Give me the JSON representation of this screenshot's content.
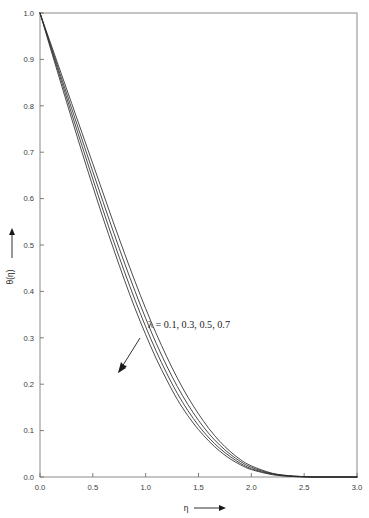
{
  "figure": {
    "background_color": "#ffffff",
    "frame_color": "#8a8a8a",
    "curve_color": "#2b2b2b"
  },
  "chart_data": {
    "type": "line",
    "title": "",
    "subtitle": "",
    "xlabel": "η",
    "ylabel": "θ(η)",
    "xlabel_arrow": "⟶",
    "ylabel_arrow": "⟶",
    "xlim": [
      0.0,
      3.0
    ],
    "ylim": [
      0.0,
      1.0
    ],
    "xticks": [
      "0.0",
      "0.5",
      "1.0",
      "1.5",
      "2.0",
      "2.5",
      "3.0"
    ],
    "xtick_values": [
      0.0,
      0.5,
      1.0,
      1.5,
      2.0,
      2.5,
      3.0
    ],
    "yticks": [
      "0.0",
      "0.1",
      "0.2",
      "0.3",
      "0.4",
      "0.5",
      "0.6",
      "0.7",
      "0.8",
      "0.9",
      "1.0"
    ],
    "ytick_values": [
      0.0,
      0.1,
      0.2,
      0.3,
      0.4,
      0.5,
      0.6,
      0.7,
      0.8,
      0.9,
      1.0
    ],
    "grid": false,
    "legend_position": "none",
    "annotation": {
      "text": "λ = 0.1, 0.3, 0.5, 0.7",
      "symbol": "λ",
      "values": [
        0.1,
        0.3,
        0.5,
        0.7
      ],
      "x": 0.99,
      "y": 0.335,
      "arrow_direction": "down-left",
      "arrow_meaning": "increasing lambda"
    },
    "series": [
      {
        "name": "λ = 0.1",
        "lambda": 0.1,
        "x": [
          0.0,
          0.1,
          0.2,
          0.3,
          0.4,
          0.5,
          0.6,
          0.7,
          0.8,
          0.9,
          1.0,
          1.1,
          1.2,
          1.3,
          1.4,
          1.5,
          1.6,
          1.7,
          1.8,
          1.9,
          2.0,
          2.2,
          2.4,
          2.6,
          2.8,
          3.0
        ],
        "y": [
          1.0,
          0.935,
          0.87,
          0.805,
          0.74,
          0.675,
          0.61,
          0.545,
          0.482,
          0.421,
          0.363,
          0.309,
          0.259,
          0.213,
          0.172,
          0.136,
          0.104,
          0.077,
          0.055,
          0.037,
          0.024,
          0.008,
          0.002,
          0.0,
          0.0,
          0.0
        ]
      },
      {
        "name": "λ = 0.3",
        "lambda": 0.3,
        "x": [
          0.0,
          0.1,
          0.2,
          0.3,
          0.4,
          0.5,
          0.6,
          0.7,
          0.8,
          0.9,
          1.0,
          1.1,
          1.2,
          1.3,
          1.4,
          1.5,
          1.6,
          1.7,
          1.8,
          1.9,
          2.0,
          2.2,
          2.4,
          2.6,
          2.8,
          3.0
        ],
        "y": [
          1.0,
          0.931,
          0.862,
          0.794,
          0.726,
          0.658,
          0.591,
          0.525,
          0.461,
          0.4,
          0.342,
          0.288,
          0.239,
          0.195,
          0.156,
          0.122,
          0.093,
          0.069,
          0.049,
          0.033,
          0.021,
          0.007,
          0.002,
          0.0,
          0.0,
          0.0
        ]
      },
      {
        "name": "λ = 0.5",
        "lambda": 0.5,
        "x": [
          0.0,
          0.1,
          0.2,
          0.3,
          0.4,
          0.5,
          0.6,
          0.7,
          0.8,
          0.9,
          1.0,
          1.1,
          1.2,
          1.3,
          1.4,
          1.5,
          1.6,
          1.7,
          1.8,
          1.9,
          2.0,
          2.2,
          2.4,
          2.6,
          2.8,
          3.0
        ],
        "y": [
          1.0,
          0.927,
          0.855,
          0.783,
          0.712,
          0.642,
          0.573,
          0.506,
          0.442,
          0.381,
          0.324,
          0.271,
          0.223,
          0.18,
          0.143,
          0.111,
          0.084,
          0.062,
          0.044,
          0.029,
          0.018,
          0.006,
          0.001,
          0.0,
          0.0,
          0.0
        ]
      },
      {
        "name": "λ = 0.7",
        "lambda": 0.7,
        "x": [
          0.0,
          0.1,
          0.2,
          0.3,
          0.4,
          0.5,
          0.6,
          0.7,
          0.8,
          0.9,
          1.0,
          1.1,
          1.2,
          1.3,
          1.4,
          1.5,
          1.6,
          1.7,
          1.8,
          1.9,
          2.0,
          2.2,
          2.4,
          2.6,
          2.8,
          3.0
        ],
        "y": [
          1.0,
          0.923,
          0.847,
          0.772,
          0.698,
          0.626,
          0.556,
          0.489,
          0.424,
          0.363,
          0.307,
          0.255,
          0.209,
          0.167,
          0.132,
          0.102,
          0.077,
          0.056,
          0.039,
          0.026,
          0.016,
          0.005,
          0.001,
          0.0,
          0.0,
          0.0
        ]
      }
    ]
  },
  "layout": {
    "plot_left": 40,
    "plot_right": 357,
    "plot_top": 13,
    "plot_bottom": 477
  }
}
